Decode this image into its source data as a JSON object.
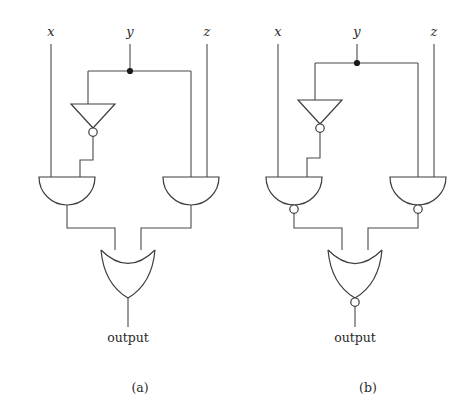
{
  "figure": {
    "background_color": "#ffffff",
    "wire_color": "#4a4a4a",
    "gate_color": "#3d3d3d",
    "junction_color": "#1a1a1a",
    "text_color": "#2a2a2a"
  },
  "panels": [
    {
      "id": "a",
      "caption": "(a)",
      "caption_x": 140,
      "caption_y": 392,
      "inputs": [
        {
          "name": "x",
          "label": "x",
          "label_x": 51,
          "label_y": 36,
          "line_x": 51,
          "line_top": 44,
          "line_bottom": 177
        },
        {
          "name": "y",
          "label": "y",
          "label_x": 130,
          "label_y": 36,
          "line_x": 130,
          "line_top": 44,
          "line_bottom": 71
        },
        {
          "name": "z",
          "label": "z",
          "label_x": 207,
          "label_y": 36,
          "line_x": 207,
          "line_top": 44,
          "line_bottom": 177
        }
      ],
      "bus": {
        "y": 71,
        "x_left": 88,
        "x_right": 191,
        "junction_x": 130,
        "junction_y": 71,
        "junction_r": 3.1
      },
      "gates": [
        {
          "type": "not",
          "name": "inverter-y",
          "cx": 93,
          "top_y": 104,
          "half_width": 22,
          "tip_y": 128,
          "bubble_cy": 132,
          "bubble_r": 4.2,
          "inverted_output": true
        },
        {
          "type": "and",
          "name": "and-gate-left",
          "cx": 67,
          "top_y": 177,
          "half_width": 28,
          "bottom_y": 205,
          "inverted_output": false
        },
        {
          "type": "and",
          "name": "and-gate-right",
          "cx": 191,
          "top_y": 177,
          "half_width": 28,
          "bottom_y": 205,
          "inverted_output": false
        },
        {
          "type": "or",
          "name": "or-gate-output",
          "cx": 128,
          "top_y": 250,
          "half_width": 27,
          "bottom_y": 298,
          "inverted_output": false
        }
      ],
      "output": {
        "label": "output",
        "label_x": 128,
        "label_y": 342,
        "line_top": 298,
        "line_bottom": 327
      }
    },
    {
      "id": "b",
      "caption": "(b)",
      "caption_x": 368,
      "caption_y": 392,
      "inputs": [
        {
          "name": "x",
          "label": "x",
          "label_x": 278,
          "label_y": 36,
          "line_x": 278,
          "line_top": 44,
          "line_bottom": 177
        },
        {
          "name": "y",
          "label": "y",
          "label_x": 357,
          "label_y": 36,
          "line_x": 357,
          "line_top": 44,
          "line_bottom": 63
        },
        {
          "name": "z",
          "label": "z",
          "label_x": 434,
          "label_y": 36,
          "line_x": 434,
          "line_top": 44,
          "line_bottom": 177
        }
      ],
      "bus": {
        "y": 63,
        "x_left": 315,
        "x_right": 418,
        "junction_x": 357,
        "junction_y": 63,
        "junction_r": 3.1
      },
      "gates": [
        {
          "type": "not",
          "name": "inverter-y",
          "cx": 320,
          "top_y": 100,
          "half_width": 22,
          "tip_y": 124,
          "bubble_cy": 128,
          "bubble_r": 4.2,
          "inverted_output": true
        },
        {
          "type": "nand",
          "name": "nand-gate-left",
          "cx": 294,
          "top_y": 177,
          "half_width": 28,
          "bottom_y": 205,
          "bubble_cy": 209,
          "bubble_r": 4.2,
          "inverted_output": true
        },
        {
          "type": "nand",
          "name": "nand-gate-right",
          "cx": 418,
          "top_y": 177,
          "half_width": 28,
          "bottom_y": 205,
          "bubble_cy": 209,
          "bubble_r": 4.2,
          "inverted_output": true
        },
        {
          "type": "nor",
          "name": "nor-gate-output",
          "cx": 355,
          "top_y": 250,
          "half_width": 27,
          "bottom_y": 298,
          "bubble_cy": 302,
          "bubble_r": 4.2,
          "inverted_output": true
        }
      ],
      "output": {
        "label": "output",
        "label_x": 355,
        "label_y": 342,
        "line_top": 306,
        "line_bottom": 327
      }
    }
  ],
  "logic": {
    "panel_a_expression": "(x AND NOT y) OR (y AND z)",
    "panel_b_expression": "NOT( NAND(x, NOT y) OR NAND(y, z) )",
    "gate_types_present": [
      "NOT",
      "AND",
      "OR",
      "NAND",
      "NOR"
    ]
  }
}
